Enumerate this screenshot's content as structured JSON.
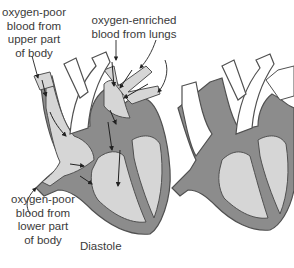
{
  "figure": {
    "caption": "Diastole",
    "colors": {
      "background": "#ffffff",
      "chamber_fill": "#d6d6d6",
      "wall_fill": "#8c8c8c",
      "vessel_fill": "#ffffff",
      "outline": "#505050",
      "text": "#3a3a3a"
    }
  },
  "labels": {
    "upper_body": "oxygen-poor\nblood from\nupper part\nof body",
    "lungs": "oxygen-enriched\nblood from lungs",
    "lower_body": "oxygen-poor\nblood from\nlower part\nof body"
  },
  "hearts": [
    {
      "name": "heart-diastole-with-flow",
      "arrows": true
    },
    {
      "name": "heart-outline",
      "arrows": false
    }
  ]
}
